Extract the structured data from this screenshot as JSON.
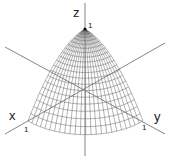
{
  "diagram": {
    "surface": "z = 1 - x^2 - y^2, x >= 0, y >= 0",
    "colors": {
      "mesh": "#555555",
      "axis": "#777777",
      "text": "#222222",
      "background": "#ffffff"
    },
    "projection": {
      "origin": [
        85,
        88
      ],
      "x_unit": [
        -57,
        33
      ],
      "y_unit": [
        58,
        33
      ],
      "z_unit": [
        0,
        -59
      ]
    },
    "mesh": {
      "meridians": 24,
      "levels": 20
    },
    "axes": {
      "x": {
        "label": "x",
        "tick": "1"
      },
      "y": {
        "label": "y",
        "tick": "1"
      },
      "z": {
        "label": "z",
        "tick": "1"
      }
    }
  }
}
